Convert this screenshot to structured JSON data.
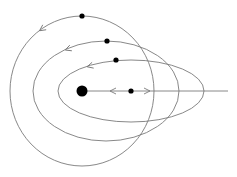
{
  "diagram": {
    "type": "orbit-diagram",
    "colors": {
      "line": "#7a7a7a",
      "dot": "#000000",
      "background": "#ffffff"
    },
    "central_body": {
      "cx": 82,
      "cy": 91,
      "r": 5.5
    },
    "radial_line": {
      "x1": 82,
      "y1": 91,
      "x2": 228,
      "y2": 91
    },
    "radial_body": {
      "cx": 131,
      "cy": 91,
      "r": 2.6
    },
    "radial_arrows": [
      {
        "direction": "left",
        "x": 113,
        "y": 91
      },
      {
        "direction": "right",
        "x": 147,
        "y": 91
      }
    ],
    "orbits": [
      {
        "name": "outer-orbit",
        "cx": 82,
        "cy": 91,
        "rx": 72,
        "ry": 75,
        "body": {
          "cx": 82,
          "cy": 16,
          "r": 2.6
        },
        "arrow": {
          "x": 42,
          "y": 29,
          "angle": 145
        }
      },
      {
        "name": "middle-orbit",
        "cx": 106,
        "cy": 91,
        "rx": 73,
        "ry": 50,
        "body": {
          "cx": 107,
          "cy": 41,
          "r": 2.6
        },
        "arrow": {
          "x": 68,
          "y": 49,
          "angle": 160
        }
      },
      {
        "name": "inner-orbit",
        "cx": 131,
        "cy": 91,
        "rx": 73,
        "ry": 31,
        "body": {
          "cx": 116,
          "cy": 60,
          "r": 2.6
        },
        "arrow": {
          "x": 90,
          "y": 66,
          "angle": 165
        }
      }
    ]
  }
}
